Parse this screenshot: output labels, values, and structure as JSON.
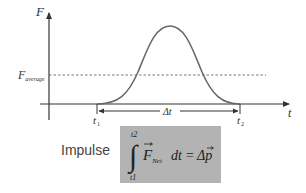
{
  "diagram": {
    "axes": {
      "y_label": "F",
      "x_label": "t"
    },
    "reference_line": {
      "label_main": "F",
      "label_sub": "average",
      "style": "dashed"
    },
    "time_markers": {
      "t1_main": "t",
      "t1_sub": "1",
      "t2_main": "t",
      "t2_sub": "2",
      "interval_label": "Δt"
    },
    "curve": {
      "shape": "bell-shaped force pulse",
      "start": "t1",
      "end": "t2"
    },
    "impulse": {
      "label": "Impulse",
      "formula": {
        "integral_upper": "t2",
        "integral_lower": "t1",
        "integrand_main": "F",
        "integrand_sub": "Net",
        "differential": "dt",
        "equals": "=",
        "result": "Δp"
      },
      "box_color": "#b3b3b3"
    },
    "colors": {
      "axis": "#333333",
      "curve": "#666666",
      "dashed": "#777777",
      "text": "#333333"
    }
  }
}
